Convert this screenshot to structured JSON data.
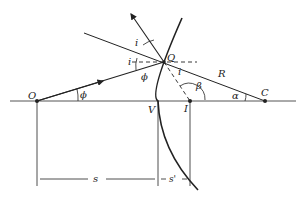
{
  "diagram": {
    "type": "refraction at a spherical surface",
    "points": {
      "O": "O",
      "V": "V",
      "I": "I",
      "C": "C",
      "Q": "Q"
    },
    "labels": {
      "radius": "R",
      "angle_phi_axis": "ϕ",
      "angle_phi_ray": "ϕ",
      "angle_i_upper": "i",
      "angle_i_left": "i",
      "angle_i_refracted": "i",
      "angle_beta": "β",
      "angle_alpha": "α",
      "distance_object": "s",
      "distance_image": "s'"
    },
    "colors": {
      "line": "#222222",
      "background": "#ffffff"
    }
  }
}
